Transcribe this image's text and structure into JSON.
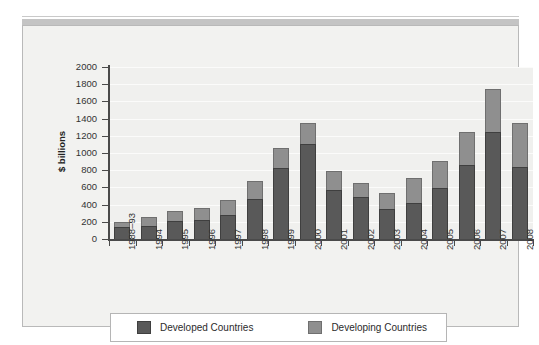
{
  "figure": {
    "background_color": "#f2f2f0",
    "band_color": "#c4c4c4"
  },
  "legend": {
    "items": [
      {
        "label": "Developed Countries",
        "color": "#595959",
        "key": "developed"
      },
      {
        "label": "Developing Countries",
        "color": "#8f8f8f",
        "key": "developing"
      }
    ]
  },
  "chart_data": {
    "type": "bar",
    "stacked": true,
    "title": "",
    "xlabel": "",
    "ylabel": "$ billions",
    "ylim": [
      0,
      2000
    ],
    "yticks": [
      0,
      200,
      400,
      600,
      800,
      1000,
      1200,
      1400,
      1600,
      1800,
      2000
    ],
    "ytick_labels": [
      "0",
      "200",
      "400",
      "600",
      "800",
      "1000",
      "1200",
      "1400",
      "1600",
      "1800",
      "2000"
    ],
    "grid": true,
    "legend_position": "bottom",
    "categories": [
      "1988–93",
      "1994",
      "1995",
      "1996",
      "1997",
      "1998",
      "1999",
      "2000",
      "2001",
      "2002",
      "2003",
      "2004",
      "2005",
      "2006",
      "2007",
      "2008"
    ],
    "series": [
      {
        "name": "Developed Countries",
        "color": "#595959",
        "values": [
          140,
          150,
          205,
          220,
          275,
          470,
          830,
          1100,
          575,
          490,
          350,
          420,
          590,
          865,
          1245,
          840
        ]
      },
      {
        "name": "Developing Countries",
        "color": "#8f8f8f",
        "values": [
          60,
          105,
          120,
          145,
          180,
          200,
          230,
          250,
          215,
          165,
          190,
          290,
          320,
          375,
          505,
          510
        ]
      }
    ],
    "totals": [
      200,
      255,
      325,
      365,
      455,
      670,
      1060,
      1350,
      790,
      655,
      540,
      710,
      910,
      1240,
      1750,
      1350
    ]
  }
}
